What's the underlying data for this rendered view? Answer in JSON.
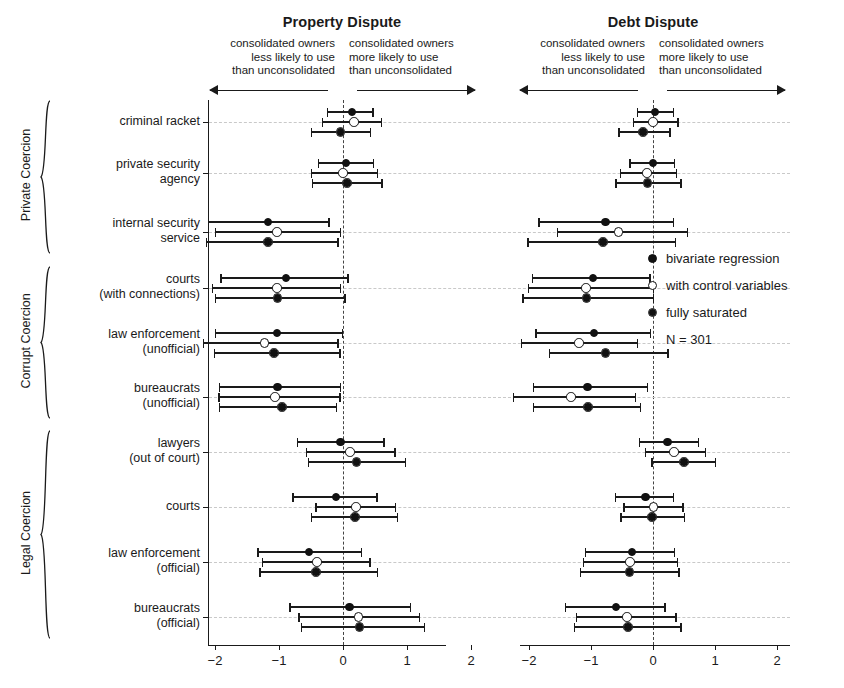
{
  "panels": [
    {
      "title": "Property Dispute",
      "note_left": "consolidated owners\nless likely to use\nthan unconsolidated",
      "note_right": "consolidated owners\nmore likely to use\nthan unconsolidated",
      "ticks": [
        "-2",
        "-1",
        "0",
        "1",
        "2"
      ]
    },
    {
      "title": "Debt Dispute",
      "note_left": "consolidated owners\nless likely to use\nthan unconsolidated",
      "note_right": "consolidated owners\nmore likely to use\nthan unconsolidated",
      "ticks": [
        "-2",
        "-1",
        "0",
        "1",
        "2"
      ]
    }
  ],
  "groups": [
    {
      "label": "Private Coercion",
      "rows": [
        0,
        1,
        2
      ]
    },
    {
      "label": "Corrupt Coercion",
      "rows": [
        3,
        4,
        5
      ]
    },
    {
      "label": "Legal Coercion",
      "rows": [
        6,
        7,
        8,
        9
      ]
    }
  ],
  "row_labels": [
    "criminal racket",
    "private security\nagency",
    "internal security\nservice",
    "courts\n(with connections)",
    "law enforcement\n(unofficial)",
    "bureaucrats\n(unofficial)",
    "lawyers\n(out of court)",
    "courts",
    "law enforcement\n(official)",
    "bureaucrats\n(official)"
  ],
  "legend": {
    "items": [
      {
        "marker": "filled",
        "label": "bivariate regression"
      },
      {
        "marker": "open",
        "label": "with control variables"
      },
      {
        "marker": "half",
        "label": "fully saturated"
      }
    ],
    "n_label": "N = 301"
  },
  "colors": {
    "ink": "#1a1a1a",
    "grid": "#c9c9c9",
    "zero": "#444444",
    "marker_fill": "#111111"
  },
  "chart_data": {
    "type": "scatter",
    "title": "",
    "xlabel": "",
    "ylabel": "",
    "xlim": [
      -2.6,
      2.4
    ],
    "grid": true,
    "legend_position": "right-middle",
    "series_names": [
      "bivariate regression",
      "with control variables",
      "fully saturated"
    ],
    "categories": [
      "criminal racket",
      "private security agency",
      "internal security service",
      "courts (with connections)",
      "law enforcement (unofficial)",
      "bureaucrats (unofficial)",
      "lawyers (out of court)",
      "courts",
      "law enforcement (official)",
      "bureaucrats (official)"
    ],
    "panels": [
      {
        "name": "Property Dispute",
        "estimates": [
          {
            "category": "criminal racket",
            "bivariate": {
              "est": 0.14,
              "lo": -0.25,
              "hi": 0.46
            },
            "controls": {
              "est": 0.17,
              "lo": -0.33,
              "hi": 0.59
            },
            "saturated": {
              "est": -0.04,
              "lo": -0.5,
              "hi": 0.42
            }
          },
          {
            "category": "private security agency",
            "bivariate": {
              "est": 0.05,
              "lo": -0.39,
              "hi": 0.47
            },
            "controls": {
              "est": 0.0,
              "lo": -0.5,
              "hi": 0.53
            },
            "saturated": {
              "est": 0.06,
              "lo": -0.49,
              "hi": 0.6
            }
          },
          {
            "category": "internal security service",
            "bivariate": {
              "est": -1.17,
              "lo": -2.11,
              "hi": -0.23
            },
            "controls": {
              "est": -1.03,
              "lo": -2.0,
              "hi": -0.05
            },
            "saturated": {
              "est": -1.17,
              "lo": -2.14,
              "hi": -0.09
            }
          },
          {
            "category": "courts (with connections)",
            "bivariate": {
              "est": -0.89,
              "lo": -1.92,
              "hi": 0.07
            },
            "controls": {
              "est": -1.03,
              "lo": -2.05,
              "hi": -0.05
            },
            "saturated": {
              "est": -1.02,
              "lo": -2.0,
              "hi": 0.02
            }
          },
          {
            "category": "law enforcement (unofficial)",
            "bivariate": {
              "est": -1.03,
              "lo": -2.0,
              "hi": -0.02
            },
            "controls": {
              "est": -1.23,
              "lo": -2.19,
              "hi": -0.09
            },
            "saturated": {
              "est": -1.08,
              "lo": -2.02,
              "hi": -0.06
            }
          },
          {
            "category": "bureaucrats (unofficial)",
            "bivariate": {
              "est": -1.02,
              "lo": -1.94,
              "hi": -0.05
            },
            "controls": {
              "est": -1.06,
              "lo": -1.95,
              "hi": -0.06
            },
            "saturated": {
              "est": -0.95,
              "lo": -1.94,
              "hi": -0.11
            }
          },
          {
            "category": "lawyers (out of court)",
            "bivariate": {
              "est": -0.04,
              "lo": -0.72,
              "hi": 0.63
            },
            "controls": {
              "est": 0.11,
              "lo": -0.58,
              "hi": 0.8
            },
            "saturated": {
              "est": 0.21,
              "lo": -0.55,
              "hi": 0.97
            }
          },
          {
            "category": "courts",
            "bivariate": {
              "est": -0.11,
              "lo": -0.79,
              "hi": 0.52
            },
            "controls": {
              "est": 0.2,
              "lo": -0.43,
              "hi": 0.81
            },
            "saturated": {
              "est": 0.19,
              "lo": -0.5,
              "hi": 0.84
            }
          },
          {
            "category": "law enforcement (official)",
            "bivariate": {
              "est": -0.53,
              "lo": -1.34,
              "hi": 0.28
            },
            "controls": {
              "est": -0.41,
              "lo": -1.27,
              "hi": 0.41
            },
            "saturated": {
              "est": -0.42,
              "lo": -1.31,
              "hi": 0.53
            }
          },
          {
            "category": "bureaucrats (official)",
            "bivariate": {
              "est": 0.1,
              "lo": -0.84,
              "hi": 1.04
            },
            "controls": {
              "est": 0.24,
              "lo": -0.7,
              "hi": 1.18
            },
            "saturated": {
              "est": 0.26,
              "lo": -0.66,
              "hi": 1.26
            }
          }
        ]
      },
      {
        "name": "Debt Dispute",
        "estimates": [
          {
            "category": "criminal racket",
            "bivariate": {
              "est": 0.03,
              "lo": -0.26,
              "hi": 0.32
            },
            "controls": {
              "est": 0.0,
              "lo": -0.33,
              "hi": 0.39
            },
            "saturated": {
              "est": -0.16,
              "lo": -0.56,
              "hi": 0.26
            }
          },
          {
            "category": "private security agency",
            "bivariate": {
              "est": 0.0,
              "lo": -0.38,
              "hi": 0.34
            },
            "controls": {
              "est": -0.1,
              "lo": -0.54,
              "hi": 0.37
            },
            "saturated": {
              "est": -0.09,
              "lo": -0.61,
              "hi": 0.44
            }
          },
          {
            "category": "internal security service",
            "bivariate": {
              "est": -0.77,
              "lo": -1.85,
              "hi": 0.32
            },
            "controls": {
              "est": -0.56,
              "lo": -1.55,
              "hi": 0.55
            },
            "saturated": {
              "est": -0.81,
              "lo": -2.03,
              "hi": 0.35
            }
          },
          {
            "category": "courts (with connections)",
            "bivariate": {
              "est": -0.97,
              "lo": -1.95,
              "hi": -0.06
            },
            "controls": {
              "est": -1.08,
              "lo": -2.02,
              "hi": 0.0
            },
            "saturated": {
              "est": -1.07,
              "lo": -2.11,
              "hi": 0.0
            }
          },
          {
            "category": "law enforcement (unofficial)",
            "bivariate": {
              "est": -0.95,
              "lo": -1.9,
              "hi": -0.05
            },
            "controls": {
              "est": -1.19,
              "lo": -2.13,
              "hi": -0.26
            },
            "saturated": {
              "est": -0.77,
              "lo": -1.68,
              "hi": 0.23
            }
          },
          {
            "category": "bureaucrats (unofficial)",
            "bivariate": {
              "est": -1.06,
              "lo": -1.94,
              "hi": -0.1
            },
            "controls": {
              "est": -1.32,
              "lo": -2.26,
              "hi": -0.29
            },
            "saturated": {
              "est": -1.05,
              "lo": -1.94,
              "hi": -0.21
            }
          },
          {
            "category": "lawyers (out of court)",
            "bivariate": {
              "est": 0.23,
              "lo": -0.23,
              "hi": 0.72
            },
            "controls": {
              "est": 0.34,
              "lo": -0.13,
              "hi": 0.84
            },
            "saturated": {
              "est": 0.5,
              "lo": -0.03,
              "hi": 1.0
            }
          },
          {
            "category": "courts",
            "bivariate": {
              "est": -0.12,
              "lo": -0.62,
              "hi": 0.32
            },
            "controls": {
              "est": 0.01,
              "lo": -0.48,
              "hi": 0.47
            },
            "saturated": {
              "est": -0.02,
              "lo": -0.53,
              "hi": 0.5
            }
          },
          {
            "category": "law enforcement (official)",
            "bivariate": {
              "est": -0.34,
              "lo": -1.1,
              "hi": 0.34
            },
            "controls": {
              "est": -0.37,
              "lo": -1.13,
              "hi": 0.38
            },
            "saturated": {
              "est": -0.38,
              "lo": -1.18,
              "hi": 0.41
            }
          },
          {
            "category": "bureaucrats (official)",
            "bivariate": {
              "est": -0.6,
              "lo": -1.42,
              "hi": 0.18
            },
            "controls": {
              "est": -0.42,
              "lo": -1.25,
              "hi": 0.36
            },
            "saturated": {
              "est": -0.4,
              "lo": -1.28,
              "hi": 0.44
            }
          }
        ]
      }
    ]
  }
}
